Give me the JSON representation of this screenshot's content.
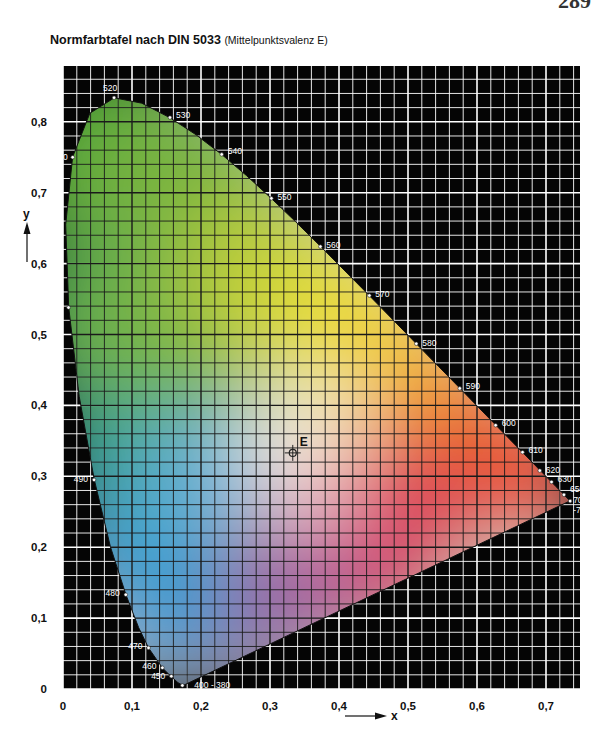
{
  "page": {
    "number": "289"
  },
  "header": {
    "title": "Normfarbtafel nach DIN 5033",
    "subtitle": "(Mittelpunktsvalenz E)"
  },
  "chart_data": {
    "type": "scatter",
    "title": "Normfarbtafel nach DIN 5033 (Mittelpunktsvalenz E)",
    "xlabel": "x",
    "ylabel": "y",
    "xlim": [
      0,
      0.75
    ],
    "ylim": [
      0,
      0.88
    ],
    "x_ticks": [
      "0",
      "0,1",
      "0,2",
      "0,3",
      "0,4",
      "0,5",
      "0,6",
      "0,7"
    ],
    "y_ticks": [
      "0",
      "0,1",
      "0,2",
      "0,3",
      "0,4",
      "0,5",
      "0,6",
      "0,7",
      "0,8"
    ],
    "grid": {
      "on": true,
      "minor_step": 0.02,
      "major_step": 0.1,
      "background": "#000000",
      "line_color": "#ffffff"
    },
    "spectral_locus": [
      {
        "label": "400 - 380",
        "x": 0.173,
        "y": 0.005
      },
      {
        "label": "450",
        "x": 0.157,
        "y": 0.018
      },
      {
        "label": "460",
        "x": 0.144,
        "y": 0.03
      },
      {
        "label": "470",
        "x": 0.124,
        "y": 0.058
      },
      {
        "label": "480",
        "x": 0.091,
        "y": 0.133
      },
      {
        "label": "490",
        "x": 0.045,
        "y": 0.295
      },
      {
        "label": "500",
        "x": 0.008,
        "y": 0.538
      },
      {
        "label": "510",
        "x": 0.014,
        "y": 0.75
      },
      {
        "label": "520",
        "x": 0.074,
        "y": 0.834
      },
      {
        "label": "530",
        "x": 0.155,
        "y": 0.806
      },
      {
        "label": "540",
        "x": 0.23,
        "y": 0.754
      },
      {
        "label": "550",
        "x": 0.302,
        "y": 0.692
      },
      {
        "label": "560",
        "x": 0.373,
        "y": 0.624
      },
      {
        "label": "570",
        "x": 0.444,
        "y": 0.555
      },
      {
        "label": "580",
        "x": 0.512,
        "y": 0.487
      },
      {
        "label": "590",
        "x": 0.575,
        "y": 0.424
      },
      {
        "label": "600",
        "x": 0.627,
        "y": 0.372
      },
      {
        "label": "610",
        "x": 0.666,
        "y": 0.334
      },
      {
        "label": "620",
        "x": 0.691,
        "y": 0.308
      },
      {
        "label": "630",
        "x": 0.708,
        "y": 0.292
      },
      {
        "label": "650",
        "x": 0.726,
        "y": 0.274
      },
      {
        "label": "700",
        "x": 0.735,
        "y": 0.265
      },
      {
        "label": "-750",
        "x": 0.735,
        "y": 0.265
      }
    ],
    "white_point": {
      "label": "E",
      "x": 0.333,
      "y": 0.333
    }
  },
  "axes": {
    "x_letter": "x",
    "y_letter": "y"
  }
}
